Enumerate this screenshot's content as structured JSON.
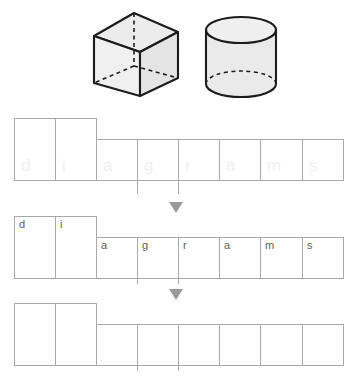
{
  "worksheet": {
    "title": "Handwriting tracing worksheet",
    "word": "diagrams",
    "colors": {
      "grid_line": "#a9a9a9",
      "letter": "#5d5d5d",
      "ghost_letter": "#f0f0f0",
      "arrow": "#9a9a9a",
      "shape_outline": "#1a1a1a",
      "shape_fill": "#e8e8e8",
      "background": "#ffffff"
    }
  },
  "illustration": {
    "shapes": [
      {
        "name": "cube",
        "label": "cube",
        "hidden_edges": "dashed"
      },
      {
        "name": "cylinder",
        "label": "cylinder",
        "hidden_edges": "dashed"
      }
    ]
  },
  "rows": [
    {
      "id": "row-trace-ghost",
      "style": "ghost",
      "has_arrow": false,
      "letters": [
        "d",
        "i",
        "a",
        "g",
        "r",
        "a",
        "m",
        "s"
      ]
    },
    {
      "id": "row-model",
      "style": "model",
      "has_arrow": true,
      "letters": [
        "d",
        "i",
        "a",
        "g",
        "r",
        "a",
        "m",
        "s"
      ]
    },
    {
      "id": "row-blank",
      "style": "blank",
      "has_arrow": true,
      "letters": [
        "",
        "",
        "",
        "",
        "",
        "",
        "",
        ""
      ]
    }
  ]
}
